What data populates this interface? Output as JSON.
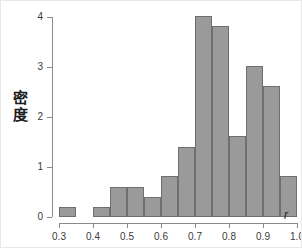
{
  "chart_data": {
    "type": "bar",
    "title": "",
    "subtitle": "",
    "xlabel": "r",
    "ylabel": "密度",
    "xlim": [
      0.3,
      1.0
    ],
    "ylim": [
      0,
      4
    ],
    "bin_width": 0.05,
    "grid": false,
    "legend": null,
    "bar_fill_color": "#9a9a9a",
    "bar_edge_color": "#6f6f6f",
    "background_color": "#ffffff",
    "axis_color": "#8a8a8a",
    "xticks": [
      "0.3",
      "0.4",
      "0.5",
      "0.6",
      "0.7",
      "0.8",
      "0.9",
      "1.0"
    ],
    "xtick_values": [
      0.3,
      0.4,
      0.5,
      0.6,
      0.7,
      0.8,
      0.9,
      1.0
    ],
    "yticks": [
      "0",
      "1",
      "2",
      "3",
      "4"
    ],
    "ytick_values": [
      0,
      1,
      2,
      3,
      4
    ],
    "bins": [
      {
        "x0": 0.3,
        "x1": 0.35,
        "value": 0.2
      },
      {
        "x0": 0.35,
        "x1": 0.4,
        "value": 0.0
      },
      {
        "x0": 0.4,
        "x1": 0.45,
        "value": 0.2
      },
      {
        "x0": 0.45,
        "x1": 0.5,
        "value": 0.61
      },
      {
        "x0": 0.5,
        "x1": 0.55,
        "value": 0.61
      },
      {
        "x0": 0.55,
        "x1": 0.6,
        "value": 0.41
      },
      {
        "x0": 0.6,
        "x1": 0.65,
        "value": 0.82
      },
      {
        "x0": 0.65,
        "x1": 0.7,
        "value": 1.41
      },
      {
        "x0": 0.7,
        "x1": 0.75,
        "value": 4.03
      },
      {
        "x0": 0.75,
        "x1": 0.8,
        "value": 3.82
      },
      {
        "x0": 0.8,
        "x1": 0.85,
        "value": 1.62
      },
      {
        "x0": 0.85,
        "x1": 0.9,
        "value": 3.02
      },
      {
        "x0": 0.9,
        "x1": 0.95,
        "value": 2.62
      },
      {
        "x0": 0.95,
        "x1": 1.0,
        "value": 0.82
      }
    ]
  }
}
